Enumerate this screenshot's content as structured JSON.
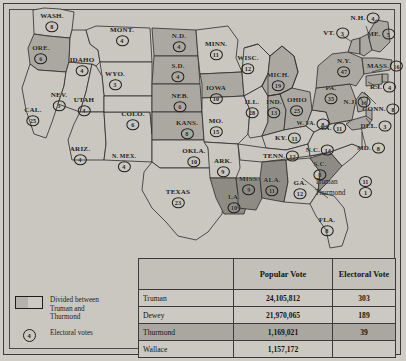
{
  "legend": {
    "split": {
      "swatch_name": "divided-swatch",
      "line1": "Divided between",
      "line2": "Truman and",
      "line3": "Thurmond"
    },
    "electoral": {
      "symbol": "4",
      "label": "Electoral votes"
    }
  },
  "annotation_tennessee": {
    "rows": [
      {
        "name": "Truman",
        "votes": "11"
      },
      {
        "name": "Thurmond",
        "votes": "1"
      }
    ]
  },
  "table": {
    "headers": [
      "",
      "Popular Vote",
      "Electoral Vote"
    ],
    "rows": [
      {
        "name": "Truman",
        "popular": "24,105,812",
        "electoral": "303",
        "highlight": false
      },
      {
        "name": "Dewey",
        "popular": "21,970,065",
        "electoral": "189",
        "highlight": false
      },
      {
        "name": "Thurmond",
        "popular": "1,169,021",
        "electoral": "39",
        "highlight": true
      },
      {
        "name": "Wallace",
        "popular": "1,157,172",
        "electoral": "",
        "highlight": false
      }
    ]
  },
  "colors": {
    "page_background": "#cfcdc6",
    "map_background": "#c9c7c0",
    "truman_fill": "#c9c7c0",
    "dewey_fill": "#aaa8a1",
    "thurmond_fill": "#8d8b84",
    "ink": "#1d1d1a"
  },
  "states": [
    {
      "id": "WA",
      "label": "WASH.",
      "ev": "8",
      "winner": "Truman",
      "x": 52,
      "y": 22
    },
    {
      "id": "OR",
      "label": "ORE.",
      "ev": "6",
      "winner": "Dewey",
      "x": 41,
      "y": 54
    },
    {
      "id": "CA",
      "label": "CAL.",
      "ev": "25",
      "winner": "Truman",
      "x": 33,
      "y": 116
    },
    {
      "id": "NV",
      "label": "NEV.",
      "ev": "3",
      "winner": "Truman",
      "x": 59,
      "y": 101
    },
    {
      "id": "ID",
      "label": "IDAHO",
      "ev": "4",
      "winner": "Truman",
      "x": 82,
      "y": 66
    },
    {
      "id": "MT",
      "label": "MONT.",
      "ev": "4",
      "winner": "Truman",
      "x": 122,
      "y": 36
    },
    {
      "id": "WY",
      "label": "WYO.",
      "ev": "3",
      "winner": "Truman",
      "x": 115,
      "y": 80
    },
    {
      "id": "UT",
      "label": "UTAH",
      "ev": "4",
      "winner": "Truman",
      "x": 84,
      "y": 106
    },
    {
      "id": "AZ",
      "label": "ARIZ.",
      "ev": "4",
      "winner": "Truman",
      "x": 80,
      "y": 155
    },
    {
      "id": "NM",
      "label": "N. MEX.",
      "ev": "4",
      "winner": "Truman",
      "x": 124,
      "y": 162
    },
    {
      "id": "CO",
      "label": "COLO.",
      "ev": "6",
      "winner": "Truman",
      "x": 133,
      "y": 120
    },
    {
      "id": "ND",
      "label": "N.D.",
      "ev": "4",
      "winner": "Dewey",
      "x": 179,
      "y": 42
    },
    {
      "id": "SD",
      "label": "S.D.",
      "ev": "4",
      "winner": "Dewey",
      "x": 178,
      "y": 72
    },
    {
      "id": "NE",
      "label": "NEB.",
      "ev": "6",
      "winner": "Dewey",
      "x": 180,
      "y": 102
    },
    {
      "id": "KS",
      "label": "KANS.",
      "ev": "8",
      "winner": "Dewey",
      "x": 187,
      "y": 129
    },
    {
      "id": "OK",
      "label": "OKLA.",
      "ev": "10",
      "winner": "Truman",
      "x": 194,
      "y": 157
    },
    {
      "id": "TX",
      "label": "TEXAS",
      "ev": "23",
      "winner": "Truman",
      "x": 178,
      "y": 198
    },
    {
      "id": "MN",
      "label": "MINN.",
      "ev": "11",
      "winner": "Truman",
      "x": 216,
      "y": 50
    },
    {
      "id": "IA",
      "label": "IOWA",
      "ev": "10",
      "winner": "Dewey",
      "x": 216,
      "y": 94
    },
    {
      "id": "MO",
      "label": "MO.",
      "ev": "15",
      "winner": "Truman",
      "x": 216,
      "y": 127
    },
    {
      "id": "AR",
      "label": "ARK.",
      "ev": "9",
      "winner": "Truman",
      "x": 223,
      "y": 167
    },
    {
      "id": "LA",
      "label": "LA.",
      "ev": "10",
      "winner": "Thurmond",
      "x": 234,
      "y": 203
    },
    {
      "id": "WI",
      "label": "WISC.",
      "ev": "12",
      "winner": "Truman",
      "x": 248,
      "y": 64
    },
    {
      "id": "IL",
      "label": "ILL.",
      "ev": "28",
      "winner": "Truman",
      "x": 252,
      "y": 108
    },
    {
      "id": "MS",
      "label": "MISS.",
      "ev": "9",
      "winner": "Thurmond",
      "x": 249,
      "y": 185
    },
    {
      "id": "MI",
      "label": "MICH.",
      "ev": "19",
      "winner": "Dewey",
      "x": 278,
      "y": 81
    },
    {
      "id": "IN",
      "label": "IND.",
      "ev": "13",
      "winner": "Dewey",
      "x": 274,
      "y": 108
    },
    {
      "id": "OH",
      "label": "OHIO",
      "ev": "25",
      "winner": "Dewey",
      "x": 297,
      "y": 106
    },
    {
      "id": "KY",
      "label": "KY.",
      "ev": "11",
      "winner": "Truman",
      "x": 288,
      "y": 138
    },
    {
      "id": "TN",
      "label": "TENN.",
      "ev": "12",
      "winner": "Split",
      "x": 281,
      "y": 156
    },
    {
      "id": "AL",
      "label": "ALA.",
      "ev": "11",
      "winner": "Thurmond",
      "x": 272,
      "y": 186
    },
    {
      "id": "GA",
      "label": "GA.",
      "ev": "12",
      "winner": "Truman",
      "x": 300,
      "y": 189
    },
    {
      "id": "FL",
      "label": "FLA.",
      "ev": "8",
      "winner": "Truman",
      "x": 327,
      "y": 226
    },
    {
      "id": "SC",
      "label": "S.C.",
      "ev": "8",
      "winner": "Thurmond",
      "x": 320,
      "y": 170
    },
    {
      "id": "NC",
      "label": "N.C.",
      "ev": "14",
      "winner": "Truman",
      "x": 320,
      "y": 150
    },
    {
      "id": "VA",
      "label": "VA.",
      "ev": "11",
      "winner": "Truman",
      "x": 333,
      "y": 128
    },
    {
      "id": "WV",
      "label": "W. VA.",
      "ev": "8",
      "winner": "Truman",
      "x": 313,
      "y": 124
    },
    {
      "id": "PA",
      "label": "PA.",
      "ev": "35",
      "winner": "Dewey",
      "x": 331,
      "y": 94
    },
    {
      "id": "NY",
      "label": "N.Y.",
      "ev": "47",
      "winner": "Dewey",
      "x": 344,
      "y": 67
    },
    {
      "id": "VT",
      "label": "VT.",
      "ev": "3",
      "winner": "Dewey",
      "x": 336,
      "y": 33
    },
    {
      "id": "NH",
      "label": "N.H.",
      "ev": "4",
      "winner": "Dewey",
      "x": 365,
      "y": 18
    },
    {
      "id": "ME",
      "label": "ME.",
      "ev": "5",
      "winner": "Dewey",
      "x": 381,
      "y": 34
    },
    {
      "id": "MA",
      "label": "MASS.",
      "ev": "16",
      "winner": "Dewey",
      "x": 385,
      "y": 66
    },
    {
      "id": "RI",
      "label": "R.I.",
      "ev": "4",
      "winner": "Dewey",
      "x": 383,
      "y": 87
    },
    {
      "id": "CT",
      "label": "CONN.",
      "ev": "8",
      "winner": "Dewey",
      "x": 381,
      "y": 109
    },
    {
      "id": "NJ",
      "label": "N.J.",
      "ev": "16",
      "winner": "Dewey",
      "x": 357,
      "y": 102
    },
    {
      "id": "DE",
      "label": "DEL.",
      "ev": "3",
      "winner": "Dewey",
      "x": 376,
      "y": 126
    },
    {
      "id": "MD",
      "label": "MD.",
      "ev": "8",
      "winner": "Dewey",
      "x": 371,
      "y": 148
    }
  ]
}
